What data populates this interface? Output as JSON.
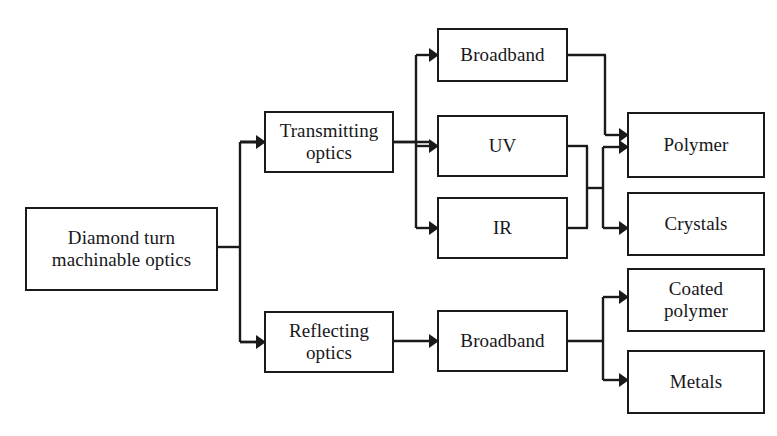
{
  "diagram": {
    "style": {
      "line_color": "#1a1a1a",
      "box_border_color": "#1a1a1a",
      "background": "#ffffff",
      "text_color": "#17171a"
    },
    "nodes": [
      {
        "id": "root",
        "label": "Diamond turn\nmachinable optics",
        "x": 25,
        "y": 207,
        "w": 193,
        "h": 84
      },
      {
        "id": "transmitting",
        "label": "Transmitting\noptics",
        "x": 264,
        "y": 111,
        "w": 130,
        "h": 62
      },
      {
        "id": "reflecting",
        "label": "Reflecting\noptics",
        "x": 264,
        "y": 311,
        "w": 130,
        "h": 62
      },
      {
        "id": "broadband_t",
        "label": "Broadband",
        "x": 437,
        "y": 28,
        "w": 131,
        "h": 54
      },
      {
        "id": "uv",
        "label": "UV",
        "x": 437,
        "y": 115,
        "w": 131,
        "h": 62
      },
      {
        "id": "ir",
        "label": "IR",
        "x": 437,
        "y": 197,
        "w": 131,
        "h": 62
      },
      {
        "id": "broadband_r",
        "label": "Broadband",
        "x": 437,
        "y": 310,
        "w": 131,
        "h": 62
      },
      {
        "id": "polymer",
        "label": "Polymer",
        "x": 627,
        "y": 112,
        "w": 138,
        "h": 66
      },
      {
        "id": "crystals",
        "label": "Crystals",
        "x": 627,
        "y": 192,
        "w": 138,
        "h": 64
      },
      {
        "id": "coated",
        "label": "Coated\npolymer",
        "x": 627,
        "y": 268,
        "w": 138,
        "h": 64
      },
      {
        "id": "metals",
        "label": "Metals",
        "x": 627,
        "y": 350,
        "w": 138,
        "h": 64
      }
    ],
    "edges": [
      {
        "id": "root-split",
        "from": "root",
        "to": "transmitting,reflecting",
        "path": "M 218 247 L 240 247 M 240 142 L 240 342 M 240 142 L 255 142 M 240 342 L 255 342"
      },
      {
        "id": "root-transmitting",
        "from": "root",
        "to": "transmitting",
        "arrow": {
          "x": 264,
          "y": 142
        }
      },
      {
        "id": "root-reflecting",
        "from": "root",
        "to": "reflecting",
        "arrow": {
          "x": 264,
          "y": 342
        }
      },
      {
        "id": "trans-split",
        "from": "transmitting",
        "to": "broadband_t,uv,ir",
        "path": "M 394 142 L 416 142 M 416 55 L 416 228 M 416 55 L 428 55 M 416 142 L 428 142 M 416 228 L 428 228"
      },
      {
        "id": "trans-broadband",
        "from": "transmitting",
        "to": "broadband_t",
        "arrow": {
          "x": 437,
          "y": 55
        }
      },
      {
        "id": "trans-uv",
        "from": "transmitting",
        "to": "uv",
        "arrow": {
          "x": 437,
          "y": 146
        }
      },
      {
        "id": "trans-ir",
        "from": "transmitting",
        "to": "ir",
        "arrow": {
          "x": 437,
          "y": 228
        }
      },
      {
        "id": "broadband-polymer",
        "from": "broadband_t",
        "to": "polymer",
        "path": "M 568 55 L 605 55 M 605 55 L 605 135 M 605 135 L 618 135",
        "arrow": {
          "x": 627,
          "y": 135
        }
      },
      {
        "id": "uvir-merge",
        "from": "uv,ir",
        "to": "junction",
        "path": "M 568 146 L 587 146 M 568 228 L 587 228 M 587 146 L 587 228 M 587 188 L 603 188 M 603 147 L 603 228"
      },
      {
        "id": "junction-polymer",
        "from": "uv,ir",
        "to": "polymer",
        "path": "M 603 147 L 618 147",
        "arrow": {
          "x": 627,
          "y": 147
        }
      },
      {
        "id": "junction-crystals",
        "from": "uv,ir",
        "to": "crystals",
        "path": "M 603 228 L 618 228",
        "arrow": {
          "x": 627,
          "y": 228
        }
      },
      {
        "id": "reflect-broadband",
        "from": "reflecting",
        "to": "broadband_r",
        "path": "M 394 341 L 428 341",
        "arrow": {
          "x": 437,
          "y": 341
        }
      },
      {
        "id": "broadband-split",
        "from": "broadband_r",
        "to": "coated,metals",
        "path": "M 568 341 L 603 341 M 603 297 L 603 380 M 603 297 L 618 297 M 603 380 L 618 380"
      },
      {
        "id": "broadband-coated",
        "from": "broadband_r",
        "to": "coated",
        "arrow": {
          "x": 627,
          "y": 297
        }
      },
      {
        "id": "broadband-metals",
        "from": "broadband_r",
        "to": "metals",
        "arrow": {
          "x": 627,
          "y": 380
        }
      }
    ],
    "labels": {
      "root": "Diamond turn\nmachinable optics",
      "transmitting": "Transmitting\noptics",
      "reflecting": "Reflecting\noptics",
      "broadband_t": "Broadband",
      "uv": "UV",
      "ir": "IR",
      "broadband_r": "Broadband",
      "polymer": "Polymer",
      "crystals": "Crystals",
      "coated": "Coated\npolymer",
      "metals": "Metals"
    }
  }
}
